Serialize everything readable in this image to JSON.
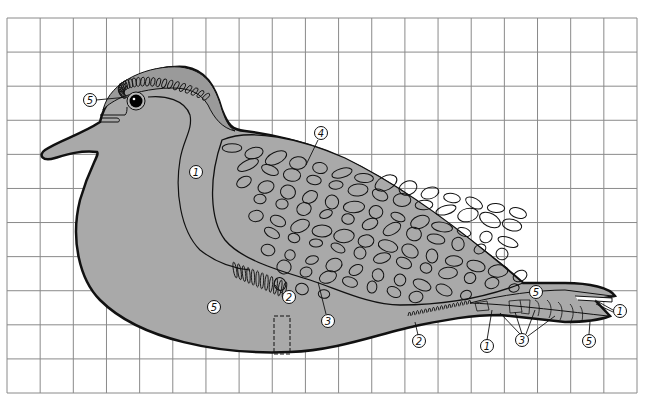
{
  "diagram": {
    "type": "painting-pattern",
    "grid": {
      "columns": 19,
      "rows": 11,
      "line_color": "#8a8a8a"
    },
    "colors": {
      "body_fill": "#a9a9a9",
      "outline": "#111111",
      "background": "#ffffff",
      "eye": "#000000"
    },
    "callouts": [
      {
        "id": "head-cap",
        "label": "5",
        "x": 90,
        "y": 100
      },
      {
        "id": "neck",
        "label": "1",
        "x": 196,
        "y": 172
      },
      {
        "id": "wing-top",
        "label": "4",
        "x": 321,
        "y": 133
      },
      {
        "id": "breast-feathers",
        "label": "2",
        "x": 289,
        "y": 297
      },
      {
        "id": "belly",
        "label": "5",
        "x": 214,
        "y": 307
      },
      {
        "id": "wing-edge",
        "label": "3",
        "x": 328,
        "y": 321
      },
      {
        "id": "under-feathers",
        "label": "2",
        "x": 419,
        "y": 341
      },
      {
        "id": "tail-left",
        "label": "1",
        "x": 487,
        "y": 346
      },
      {
        "id": "tail-bars",
        "label": "3",
        "x": 522,
        "y": 340
      },
      {
        "id": "tail-top",
        "label": "5",
        "x": 536,
        "y": 292
      },
      {
        "id": "tail-tip",
        "label": "1",
        "x": 620,
        "y": 311
      },
      {
        "id": "tail-bottom",
        "label": "5",
        "x": 589,
        "y": 341
      }
    ]
  }
}
